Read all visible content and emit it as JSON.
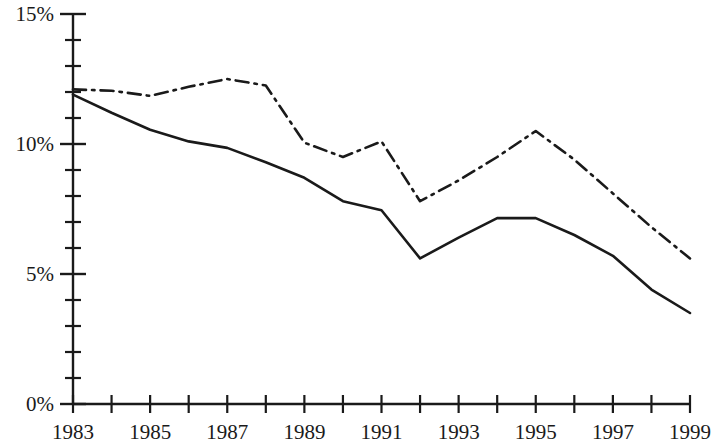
{
  "chart_data": {
    "type": "line",
    "title": "",
    "subtitle": "",
    "xlabel": "",
    "ylabel": "",
    "x": [
      1983,
      1984,
      1985,
      1986,
      1987,
      1988,
      1989,
      1990,
      1991,
      1992,
      1993,
      1994,
      1995,
      1996,
      1997,
      1998,
      1999
    ],
    "xlim": [
      1983,
      1999
    ],
    "ylim": [
      0,
      15
    ],
    "grid": false,
    "legend": "none",
    "x_tick_labels": [
      "1983",
      "1985",
      "1987",
      "1989",
      "1991",
      "1993",
      "1995",
      "1997",
      "1999"
    ],
    "x_tick_values": [
      1983,
      1985,
      1987,
      1989,
      1991,
      1993,
      1995,
      1997,
      1999
    ],
    "x_minor_tick_values": [
      1983,
      1984,
      1985,
      1986,
      1987,
      1988,
      1989,
      1990,
      1991,
      1992,
      1993,
      1994,
      1995,
      1996,
      1997,
      1998,
      1999
    ],
    "y_tick_labels": [
      "0%",
      "5%",
      "10%",
      "15%"
    ],
    "y_tick_values": [
      0,
      5,
      10,
      15
    ],
    "y_minor_tick_values": [
      0,
      1,
      2,
      3,
      4,
      5,
      6,
      7,
      8,
      9,
      10,
      11,
      12,
      13,
      14,
      15
    ],
    "y_unit": "%",
    "series": [
      {
        "name": "solid-series",
        "style": "solid",
        "color": "#1a1a1a",
        "values": [
          11.9,
          11.2,
          10.55,
          10.1,
          9.85,
          9.3,
          8.7,
          7.8,
          7.45,
          5.6,
          6.4,
          7.15,
          7.15,
          6.5,
          5.7,
          4.4,
          3.5
        ]
      },
      {
        "name": "dash-dot-series",
        "style": "dash-dot",
        "color": "#1a1a1a",
        "values": [
          12.1,
          12.05,
          11.85,
          12.2,
          12.5,
          12.25,
          10.05,
          9.5,
          10.1,
          7.8,
          8.6,
          9.5,
          10.5,
          9.4,
          8.1,
          6.8,
          5.6
        ]
      }
    ],
    "axis_color": "#1a1a1a"
  }
}
